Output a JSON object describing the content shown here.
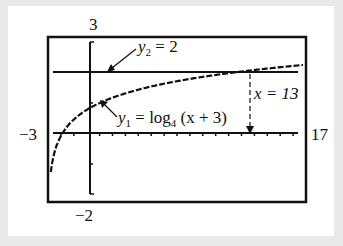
{
  "chart_data": {
    "type": "line",
    "title": "",
    "window": {
      "xmin": -3,
      "xmax": 17,
      "ymin": -2,
      "ymax": 3
    },
    "tick_labels": {
      "ymax": "3",
      "ymin": "−2",
      "xmin": "−3",
      "xmax": "17"
    },
    "xscale": 1,
    "series": [
      {
        "name": "y1 = log4 (x + 3)",
        "style": "dotted-curve",
        "x": [
          -2.75,
          -2.5,
          -2,
          -1,
          0,
          1,
          3,
          5,
          7,
          9,
          11,
          13,
          15,
          17
        ],
        "values": [
          -1.0,
          -0.5,
          0,
          0.5,
          0.79,
          1.0,
          1.29,
          1.5,
          1.66,
          1.79,
          1.9,
          2.0,
          2.08,
          2.15
        ]
      },
      {
        "name": "y2 = 2",
        "style": "line",
        "x": [
          -3,
          17
        ],
        "values": [
          2,
          2
        ]
      }
    ],
    "annotations": [
      {
        "text": "y2 = 2",
        "arrow_to": [
          -0.5,
          2
        ]
      },
      {
        "text": "y1 = log4 (x + 3)",
        "arrow_to": [
          -1.5,
          0.5
        ]
      },
      {
        "text": "x = 13",
        "type": "dashed-vertical",
        "x": 13,
        "from_y": 2,
        "to_y": 0
      }
    ]
  },
  "labels": {
    "y2_name": "y",
    "y2_sub": "2",
    "y2_rhs": " = 2",
    "y1_name": "y",
    "y1_sub": "1",
    "y1_eq": " = log",
    "y1_base": "4",
    "y1_arg": " (x + 3)",
    "x13": "x = 13"
  }
}
